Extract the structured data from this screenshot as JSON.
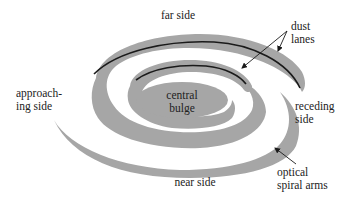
{
  "diagram": {
    "colors": {
      "arm_fill": "#a6a6a6",
      "dust_lane": "#1a1a1a",
      "background": "#ffffff",
      "text": "#222222"
    },
    "labels": {
      "far_side": "far side",
      "near_side": "near side",
      "approaching_line1": "approach-",
      "approaching_line2": "ing side",
      "receding_line1": "receding",
      "receding_line2": "side",
      "dust_lanes_line1": "dust",
      "dust_lanes_line2": "lanes",
      "optical_arms_line1": "optical",
      "optical_arms_line2": "spiral arms",
      "bulge_line1": "central",
      "bulge_line2": "bulge"
    },
    "components": [
      {
        "name": "central bulge",
        "shape": "ellipse"
      },
      {
        "name": "inner spiral arm",
        "has_dust_lane": true
      },
      {
        "name": "outer spiral arm",
        "has_dust_lane": true
      },
      {
        "name": "outermost arm segment (lower left)",
        "has_dust_lane": false
      }
    ],
    "annotations": [
      {
        "label": "dust lanes",
        "points_to": [
          "outer arm dust lane",
          "inner arm dust lane"
        ]
      },
      {
        "label": "optical spiral arms",
        "points_to": [
          "outer arm edge (lower right)"
        ]
      }
    ]
  }
}
